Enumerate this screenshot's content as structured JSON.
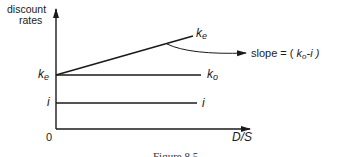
{
  "diagram": {
    "y_axis_label_line1": "discount",
    "y_axis_label_line2": "rates",
    "x_axis_label": "D/S",
    "origin_label": "0",
    "left_labels": {
      "ke_main": "k",
      "ke_sub": "e",
      "i": "i"
    },
    "line_labels": {
      "ke_main": "k",
      "ke_sub": "e",
      "ko_main": "k",
      "ko_sub": "o",
      "i": "i"
    },
    "annotation": {
      "prefix": "slope = ( ",
      "k": "k",
      "sub": "o",
      "suffix": "-i )"
    },
    "caption": "Figure 8.5",
    "lines": [
      {
        "name": "ke",
        "description": "upward sloping line starting at ke"
      },
      {
        "name": "ko",
        "description": "horizontal line at ke level"
      },
      {
        "name": "i",
        "description": "horizontal line at i level"
      }
    ],
    "colors": {
      "ink": "#1a1a1a",
      "background": "#ffffff"
    }
  }
}
